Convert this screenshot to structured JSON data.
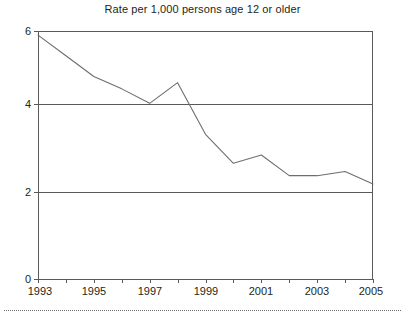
{
  "chart_data": {
    "type": "line",
    "title": "Rate per 1,000 persons age 12 or older",
    "xlabel": "",
    "ylabel": "",
    "x": [
      1993,
      1994,
      1995,
      1996,
      1997,
      1998,
      1999,
      2000,
      2001,
      2002,
      2003,
      2004,
      2005
    ],
    "values": [
      5.9,
      5.4,
      4.9,
      4.6,
      4.25,
      4.75,
      3.5,
      2.8,
      3.0,
      2.5,
      2.5,
      2.6,
      2.3
    ],
    "series": [
      {
        "name": "Rate per 1,000 persons age 12 or older",
        "values": [
          5.9,
          5.4,
          4.9,
          4.6,
          4.25,
          4.75,
          3.5,
          2.8,
          3.0,
          2.5,
          2.5,
          2.6,
          2.3
        ]
      }
    ],
    "xlim": [
      1993,
      2005
    ],
    "ylim": [
      0,
      6
    ],
    "y_ticks": [
      0,
      2,
      4,
      6
    ],
    "y_tick_labels": [
      "0",
      "2",
      "4",
      "6"
    ],
    "x_ticks": [
      1993,
      1994,
      1995,
      1996,
      1997,
      1998,
      1999,
      2000,
      2001,
      2002,
      2003,
      2004,
      2005
    ],
    "x_tick_labels_shown": [
      "1993",
      "1995",
      "1997",
      "1999",
      "2001",
      "2003",
      "2005"
    ],
    "gridlines": {
      "horizontal_at": [
        2,
        4
      ],
      "vertical": false
    },
    "legend": null,
    "line_color": "#6d6e71",
    "axis_color": "#58595b",
    "background_color": "#ffffff"
  },
  "axis": {
    "y_labels": {
      "t0": "0",
      "t2": "2",
      "t4": "4",
      "t6": "6"
    },
    "x_labels": {
      "l1993": "1993",
      "l1995": "1995",
      "l1997": "1997",
      "l1999": "1999",
      "l2001": "2001",
      "l2003": "2003",
      "l2005": "2005"
    }
  }
}
